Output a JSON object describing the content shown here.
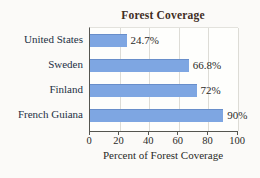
{
  "chart_data": {
    "type": "bar",
    "orientation": "horizontal",
    "title": "Forest Coverage",
    "xlabel": "Percent of Forest Coverage",
    "categories": [
      "United States",
      "Sweden",
      "Finland",
      "French Guiana"
    ],
    "values": [
      24.7,
      66.8,
      72,
      90
    ],
    "value_labels": [
      "24.7%",
      "66.8%",
      "72%",
      "90%"
    ],
    "xticks": [
      0,
      20,
      40,
      60,
      80,
      100
    ],
    "xlim": [
      0,
      100
    ],
    "grid": "vertical-light",
    "legend": "none",
    "bar_color": "#7ea6e2",
    "axis_color": "#555550",
    "gridline_color": "#dddcd6",
    "title_color": "#3f2d24",
    "category_label_color": "#233044"
  }
}
